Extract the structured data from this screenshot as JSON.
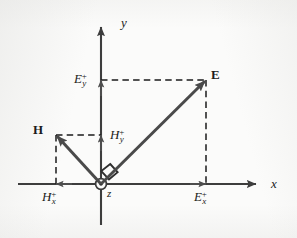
{
  "figure": {
    "kind": "vector-decomposition-diagram",
    "colors": {
      "background": "#fbfbfa",
      "axis": "#3d3d3d",
      "vector": "#4a4a4a",
      "dashed": "#1b1b1b",
      "text": "#1b1b1b"
    },
    "axes": {
      "x_label": "x",
      "y_label": "y",
      "z_label": "z",
      "z_marker": "circle-dot-out-of-page"
    },
    "vectors": [
      {
        "name": "E-vector",
        "label": "E",
        "tip": {
          "x": 206,
          "y": 80
        },
        "tail": {
          "x": 101,
          "y": 184
        },
        "quadrant": "first"
      },
      {
        "name": "H-vector",
        "label": "H",
        "tip": {
          "x": 56,
          "y": 135
        },
        "tail": {
          "x": 101,
          "y": 184
        },
        "quadrant": "second"
      }
    ],
    "components": [
      {
        "name": "E-y-component",
        "base": "E",
        "sub": "y",
        "sup": "+",
        "axis": "y",
        "value_px": 80,
        "direction": "up"
      },
      {
        "name": "E-x-component",
        "base": "E",
        "sub": "x",
        "sup": "+",
        "axis": "x",
        "value_px": 206,
        "direction": "right"
      },
      {
        "name": "H-y-component",
        "base": "H",
        "sub": "y",
        "sup": "+",
        "axis": "y",
        "value_px": 135,
        "direction": "up"
      },
      {
        "name": "H-x-component",
        "base": "H",
        "sub": "x",
        "sup": "+",
        "axis": "x",
        "value_px": 56,
        "direction": "left"
      }
    ],
    "annotations": [
      {
        "name": "right-angle-marker",
        "note": "square marker between E and H vectors at the origin"
      }
    ],
    "labels": {
      "E": "E",
      "H": "H",
      "x": "x",
      "y": "y",
      "z": "z",
      "Ey_base": "E",
      "Ey_sub": "y",
      "Ey_sup": "+",
      "Ex_base": "E",
      "Ex_sub": "x",
      "Ex_sup": "+",
      "Hy_base": "H",
      "Hy_sub": "y",
      "Hy_sup": "+",
      "Hx_base": "H",
      "Hx_sub": "x",
      "Hx_sup": "+"
    }
  }
}
